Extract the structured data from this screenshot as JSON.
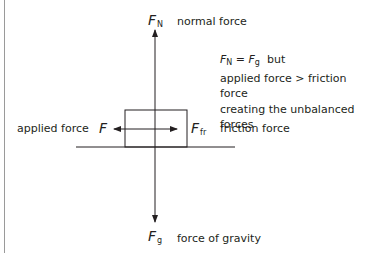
{
  "diagram": {
    "type": "free-body-diagram",
    "forces": {
      "normal": {
        "symbol": "F",
        "subscript": "N",
        "label": "normal force",
        "direction": "up"
      },
      "gravity": {
        "symbol": "F",
        "subscript": "g",
        "label": "force of gravity",
        "direction": "down"
      },
      "applied": {
        "symbol": "F",
        "subscript": "",
        "label": "applied force",
        "direction": "left"
      },
      "friction": {
        "symbol": "F",
        "subscript": "fr",
        "label": "friction force",
        "direction": "right"
      }
    },
    "note": {
      "eq_left_symbol": "F",
      "eq_left_sub": "N",
      "eq_op": " = ",
      "eq_right_symbol": "F",
      "eq_right_sub": "g",
      "eq_tail": "  but",
      "line2": "applied force > friction force",
      "line3": "creating the unbalanced forces"
    },
    "colors": {
      "stroke": "#231f20",
      "border": "#9a9a9a",
      "background": "#ffffff"
    }
  }
}
